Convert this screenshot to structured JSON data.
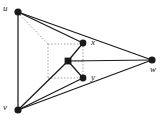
{
  "figure": {
    "kind": "graph-diagram",
    "background_color": "#ffffff",
    "width": 163,
    "height": 122,
    "edge_color": "#1a1a1a",
    "node_color": "#1a1a1a",
    "dotted_color": "#9a9a9a"
  },
  "nodes": [
    {
      "id": "u",
      "label": "u",
      "x": 18,
      "y": 12,
      "r": 3.6,
      "shape": "circle",
      "label_x": 3,
      "label_y": 4
    },
    {
      "id": "v",
      "label": "v",
      "x": 18,
      "y": 110,
      "r": 3.6,
      "shape": "circle",
      "label_x": 3,
      "label_y": 103
    },
    {
      "id": "w",
      "label": "w",
      "x": 152,
      "y": 60,
      "r": 3.6,
      "shape": "circle",
      "label_x": 150,
      "label_y": 65
    },
    {
      "id": "x",
      "label": "x",
      "x": 83,
      "y": 43,
      "r": 3.4,
      "shape": "circle",
      "label_x": 91,
      "label_y": 38
    },
    {
      "id": "y",
      "label": "y",
      "x": 83,
      "y": 78,
      "r": 3.4,
      "shape": "circle",
      "label_x": 91,
      "label_y": 73
    },
    {
      "id": "center",
      "label": "",
      "x": 68,
      "y": 61,
      "r": 3.4,
      "shape": "square",
      "label_x": 0,
      "label_y": 0
    }
  ],
  "solid_edges": [
    {
      "from": "u",
      "to": "v",
      "name": "edge-u-v"
    },
    {
      "from": "u",
      "to": "x",
      "name": "edge-u-x"
    },
    {
      "from": "u",
      "to": "w",
      "name": "edge-u-w"
    },
    {
      "from": "v",
      "to": "w",
      "name": "edge-v-w"
    },
    {
      "from": "v",
      "to": "y",
      "name": "edge-v-y"
    },
    {
      "from": "v",
      "to": "center",
      "name": "edge-v-center"
    },
    {
      "from": "center",
      "to": "x",
      "name": "edge-center-x"
    },
    {
      "from": "center",
      "to": "y",
      "name": "edge-center-y"
    },
    {
      "from": "center",
      "to": "w",
      "name": "edge-center-w"
    }
  ],
  "dotted_edges": [
    {
      "name": "dotted-u-corner",
      "x1": 20,
      "y1": 15,
      "x2": 48,
      "y2": 44
    },
    {
      "name": "dotted-top",
      "x1": 48,
      "y1": 44,
      "x2": 83,
      "y2": 44
    },
    {
      "name": "dotted-left",
      "x1": 48,
      "y1": 44,
      "x2": 48,
      "y2": 78
    },
    {
      "name": "dotted-bottom",
      "x1": 48,
      "y1": 78,
      "x2": 83,
      "y2": 78
    },
    {
      "name": "dotted-x-center",
      "x1": 83,
      "y1": 46,
      "x2": 83,
      "y2": 61
    },
    {
      "name": "dotted-center-y",
      "x1": 83,
      "y1": 61,
      "x2": 83,
      "y2": 76
    },
    {
      "name": "dotted-mid-horiz",
      "x1": 68,
      "y1": 61,
      "x2": 83,
      "y2": 61
    }
  ]
}
